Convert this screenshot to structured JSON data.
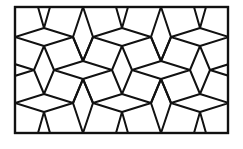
{
  "diagram": {
    "type": "geometric-tiling",
    "colors": {
      "stroke": "#111111",
      "fill": "#ffffff"
    },
    "frame": {
      "x": 15,
      "y": 7,
      "width": 213,
      "height": 126
    },
    "shapes": [
      "rhombus-horizontal",
      "rhombus-vertical",
      "pentagon"
    ]
  }
}
